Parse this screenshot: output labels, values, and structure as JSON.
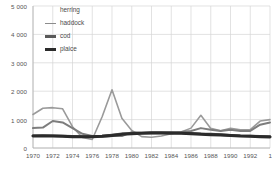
{
  "chart_data": {
    "type": "line",
    "title": "",
    "subtitle": "",
    "xlabel": "",
    "ylabel": "",
    "xlim": [
      1970,
      1994
    ],
    "ylim": [
      0,
      5000
    ],
    "grid": true,
    "legend_position": "top-left",
    "y_ticks": [
      {
        "value": 0,
        "label": "0"
      },
      {
        "value": 1000,
        "label": "1 000"
      },
      {
        "value": 2000,
        "label": "2 000"
      },
      {
        "value": 3000,
        "label": "3 000"
      },
      {
        "value": 4000,
        "label": "4 000"
      },
      {
        "value": 5000,
        "label": "5 000"
      }
    ],
    "x_ticks": [
      {
        "value": 1970,
        "label": "1970"
      },
      {
        "value": 1972,
        "label": "1972"
      },
      {
        "value": 1974,
        "label": "1974"
      },
      {
        "value": 1976,
        "label": "1976"
      },
      {
        "value": 1978,
        "label": "1978"
      },
      {
        "value": 1980,
        "label": "1980"
      },
      {
        "value": 1982,
        "label": "1982"
      },
      {
        "value": 1984,
        "label": "1984"
      },
      {
        "value": 1986,
        "label": "1986"
      },
      {
        "value": 1988,
        "label": "1988"
      },
      {
        "value": 1990,
        "label": "1990"
      },
      {
        "value": 1992,
        "label": "1992"
      },
      {
        "value": 1994,
        "label": "19"
      }
    ],
    "x": [
      1970,
      1971,
      1972,
      1973,
      1974,
      1975,
      1976,
      1977,
      1978,
      1979,
      1980,
      1981,
      1982,
      1983,
      1984,
      1985,
      1986,
      1987,
      1988,
      1989,
      1990,
      1991,
      1992,
      1993,
      1994
    ],
    "series": [
      {
        "name": "herring",
        "color": "#9a9a9a",
        "width": 1.6,
        "values": [
          1180,
          1400,
          1420,
          1380,
          750,
          370,
          300,
          1100,
          2050,
          1050,
          620,
          400,
          380,
          420,
          500,
          560,
          700,
          1150,
          690,
          610,
          690,
          640,
          650,
          950,
          1000
        ]
      },
      {
        "name": "haddock",
        "color": "#7d7d7d",
        "width": 2.0,
        "values": [
          700,
          720,
          950,
          900,
          700,
          500,
          420,
          400,
          420,
          420,
          560,
          530,
          520,
          520,
          540,
          560,
          600,
          700,
          640,
          600,
          640,
          600,
          600,
          820,
          900
        ]
      },
      {
        "name": "cod",
        "color": "#4c4c4c",
        "width": 2.6,
        "values": [
          430,
          440,
          430,
          420,
          410,
          400,
          400,
          420,
          460,
          500,
          520,
          530,
          540,
          540,
          540,
          530,
          520,
          500,
          490,
          470,
          450,
          430,
          420,
          410,
          400
        ]
      },
      {
        "name": "plaice",
        "color": "#2b2b2b",
        "width": 3.0,
        "values": [
          420,
          425,
          420,
          415,
          400,
          395,
          395,
          410,
          440,
          480,
          505,
          515,
          525,
          525,
          520,
          515,
          505,
          485,
          470,
          455,
          440,
          420,
          410,
          400,
          390
        ]
      }
    ]
  },
  "legend": {
    "items": [
      {
        "label": "herring",
        "swatch": "none",
        "color": "#9a9a9a"
      },
      {
        "label": "haddock",
        "swatch": "thin",
        "color": "#8c8c8c"
      },
      {
        "label": "cod",
        "swatch": "mid",
        "color": "#5a5a5a"
      },
      {
        "label": "plaice",
        "swatch": "thick",
        "color": "#2b2b2b"
      }
    ]
  },
  "axis_colors": {
    "grid": "#d6d6d6",
    "axis_line": "#b0b0b0",
    "tick_text": "#555555"
  }
}
